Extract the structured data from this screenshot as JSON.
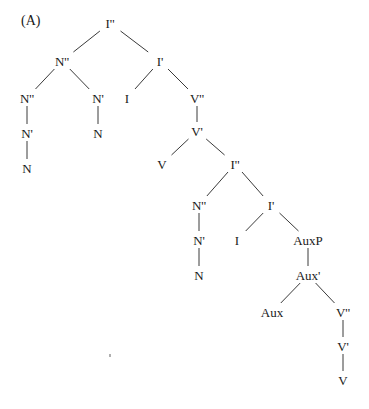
{
  "diagram": {
    "label": "(A)",
    "line_color": "#3a3a3a",
    "text_color": "#1a1a1a",
    "nodes": [
      {
        "id": "n0",
        "label": "I''",
        "x": 110,
        "y": 23
      },
      {
        "id": "n1",
        "label": "N''",
        "x": 62,
        "y": 61
      },
      {
        "id": "n2",
        "label": "I'",
        "x": 160,
        "y": 61
      },
      {
        "id": "n3",
        "label": "N''",
        "x": 27,
        "y": 98
      },
      {
        "id": "n4",
        "label": "N'",
        "x": 98,
        "y": 98
      },
      {
        "id": "n5",
        "label": "I",
        "x": 127,
        "y": 98
      },
      {
        "id": "n6",
        "label": "V''",
        "x": 197,
        "y": 98
      },
      {
        "id": "n7",
        "label": "N'",
        "x": 27,
        "y": 133
      },
      {
        "id": "n8",
        "label": "N",
        "x": 98,
        "y": 133
      },
      {
        "id": "n9",
        "label": "V'",
        "x": 197,
        "y": 131
      },
      {
        "id": "n10",
        "label": "N",
        "x": 27,
        "y": 168
      },
      {
        "id": "n11",
        "label": "V",
        "x": 162,
        "y": 164
      },
      {
        "id": "n12",
        "label": "I''",
        "x": 235,
        "y": 164
      },
      {
        "id": "n13",
        "label": "N''",
        "x": 199,
        "y": 205
      },
      {
        "id": "n14",
        "label": "I'",
        "x": 271,
        "y": 205
      },
      {
        "id": "n15",
        "label": "N'",
        "x": 199,
        "y": 240
      },
      {
        "id": "n16",
        "label": "I",
        "x": 237,
        "y": 240
      },
      {
        "id": "n17",
        "label": "AuxP",
        "x": 308,
        "y": 240
      },
      {
        "id": "n18",
        "label": "N",
        "x": 199,
        "y": 275
      },
      {
        "id": "n19",
        "label": "Aux'",
        "x": 308,
        "y": 275
      },
      {
        "id": "n20",
        "label": "Aux",
        "x": 272,
        "y": 312
      },
      {
        "id": "n21",
        "label": "V''",
        "x": 343,
        "y": 312
      },
      {
        "id": "n22",
        "label": "V'",
        "x": 343,
        "y": 346
      },
      {
        "id": "n23",
        "label": "V",
        "x": 343,
        "y": 380
      }
    ],
    "edges": [
      [
        "n0",
        "n1"
      ],
      [
        "n0",
        "n2"
      ],
      [
        "n1",
        "n3"
      ],
      [
        "n1",
        "n4"
      ],
      [
        "n2",
        "n5"
      ],
      [
        "n2",
        "n6"
      ],
      [
        "n3",
        "n7"
      ],
      [
        "n7",
        "n10"
      ],
      [
        "n4",
        "n8"
      ],
      [
        "n6",
        "n9"
      ],
      [
        "n9",
        "n11"
      ],
      [
        "n9",
        "n12"
      ],
      [
        "n12",
        "n13"
      ],
      [
        "n12",
        "n14"
      ],
      [
        "n13",
        "n15"
      ],
      [
        "n15",
        "n18"
      ],
      [
        "n14",
        "n16"
      ],
      [
        "n14",
        "n17"
      ],
      [
        "n17",
        "n19"
      ],
      [
        "n19",
        "n20"
      ],
      [
        "n19",
        "n21"
      ],
      [
        "n21",
        "n22"
      ],
      [
        "n22",
        "n23"
      ]
    ]
  }
}
